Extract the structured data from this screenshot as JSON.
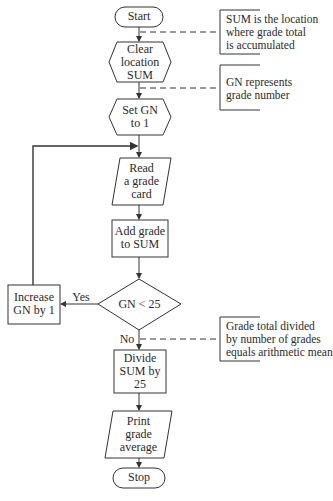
{
  "flowchart": {
    "nodes": [
      {
        "id": "start",
        "shape": "terminal",
        "lines": [
          "Start"
        ]
      },
      {
        "id": "clear",
        "shape": "preparation",
        "lines": [
          "Clear",
          "location",
          "SUM"
        ]
      },
      {
        "id": "set",
        "shape": "preparation",
        "lines": [
          "Set GN",
          "to 1"
        ]
      },
      {
        "id": "read",
        "shape": "input-output",
        "lines": [
          "Read",
          "a grade",
          "card"
        ]
      },
      {
        "id": "add",
        "shape": "process",
        "lines": [
          "Add grade",
          "to SUM"
        ]
      },
      {
        "id": "decision",
        "shape": "decision",
        "lines": [
          "GN < 25"
        ]
      },
      {
        "id": "increase",
        "shape": "process",
        "lines": [
          "Increase",
          "GN by 1"
        ]
      },
      {
        "id": "divide",
        "shape": "process",
        "lines": [
          "Divide",
          "SUM by",
          "25"
        ]
      },
      {
        "id": "print",
        "shape": "input-output",
        "lines": [
          "Print",
          "grade",
          "average"
        ]
      },
      {
        "id": "stop",
        "shape": "terminal",
        "lines": [
          "Stop"
        ]
      }
    ],
    "edges": [
      {
        "from": "start",
        "to": "clear"
      },
      {
        "from": "clear",
        "to": "set"
      },
      {
        "from": "set",
        "to": "read"
      },
      {
        "from": "read",
        "to": "add"
      },
      {
        "from": "add",
        "to": "decision"
      },
      {
        "from": "decision",
        "to": "increase",
        "label": "Yes"
      },
      {
        "from": "increase",
        "to": "read"
      },
      {
        "from": "decision",
        "to": "divide",
        "label": "No"
      },
      {
        "from": "divide",
        "to": "print"
      },
      {
        "from": "print",
        "to": "stop"
      }
    ],
    "annotations": [
      {
        "attached_to": "start-clear",
        "lines": [
          "SUM  is the location",
          "where grade total",
          "is accumulated"
        ]
      },
      {
        "attached_to": "clear-set",
        "lines": [
          "GN represents",
          "grade number"
        ]
      },
      {
        "attached_to": "decision-divide",
        "lines": [
          "Grade total divided",
          "by number of grades",
          "equals arithmetic mean"
        ]
      }
    ],
    "colors": {
      "stroke": "#333333",
      "background": "#ffffff",
      "text": "#2a2a2a"
    }
  }
}
